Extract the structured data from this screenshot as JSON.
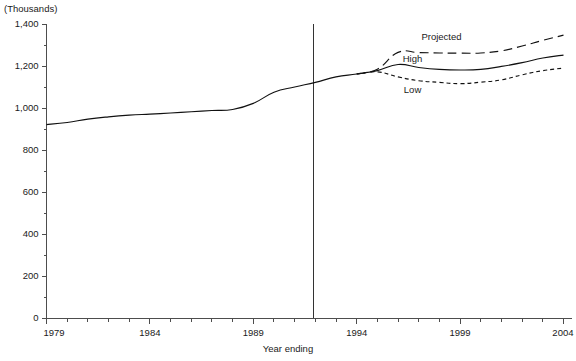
{
  "chart_data": {
    "type": "line",
    "title": "",
    "unit_label": "(Thousands)",
    "xlabel": "Year ending",
    "ylabel": "",
    "xlim": [
      1979,
      2004
    ],
    "ylim": [
      0,
      1400
    ],
    "grid": false,
    "legend_position": "inline-annotations",
    "x_ticks": [
      "1979",
      "1984",
      "1989",
      "1994",
      "1999",
      "2004"
    ],
    "x_tick_values": [
      1979,
      1984,
      1989,
      1994,
      1999,
      2004
    ],
    "x_minor_tick_interval": 1,
    "y_ticks": [
      "0",
      "200",
      "400",
      "600",
      "800",
      "1,000",
      "1,200",
      "1,400"
    ],
    "y_tick_values": [
      0,
      200,
      400,
      600,
      800,
      1000,
      1200,
      1400
    ],
    "y_minor_tick_interval": 100,
    "projection_divider_year": 1991.9,
    "projection_split_year": 1995.0,
    "annotations": [
      {
        "text": "Projected",
        "x": 1998.1,
        "y": 1325
      },
      {
        "text": "High",
        "x": 1996.7,
        "y": 1220
      },
      {
        "text": "Low",
        "x": 1996.7,
        "y": 1070
      }
    ],
    "series": [
      {
        "name": "Actual / Central",
        "style": "solid",
        "x": [
          1979,
          1980,
          1981,
          1982,
          1983,
          1984,
          1985,
          1986,
          1987,
          1988,
          1989,
          1990,
          1991,
          1992,
          1993,
          1994,
          1995,
          1996,
          1997,
          1998,
          1999,
          2000,
          2001,
          2002,
          2003,
          2004
        ],
        "values": [
          921,
          931,
          947,
          958,
          966,
          971,
          976,
          982,
          988,
          993,
          1022,
          1075,
          1100,
          1122,
          1148,
          1162,
          1178,
          1207,
          1193,
          1184,
          1181,
          1184,
          1198,
          1216,
          1238,
          1252
        ]
      },
      {
        "name": "High",
        "style": "long-dash",
        "x": [
          1994,
          1995,
          1996,
          1997,
          1998,
          1999,
          2000,
          2001,
          2002,
          2003,
          2004
        ],
        "values": [
          1162,
          1185,
          1265,
          1264,
          1262,
          1261,
          1262,
          1272,
          1295,
          1322,
          1347
        ]
      },
      {
        "name": "Low",
        "style": "short-dash",
        "x": [
          1994,
          1995,
          1996,
          1997,
          1998,
          1999,
          2000,
          2001,
          2002,
          2003,
          2004
        ],
        "values": [
          1162,
          1172,
          1148,
          1130,
          1122,
          1116,
          1123,
          1134,
          1158,
          1178,
          1190
        ]
      }
    ],
    "colors": {
      "line": "#111111",
      "axis": "#4d4d4d",
      "divider": "#333333",
      "background": "#ffffff"
    }
  }
}
